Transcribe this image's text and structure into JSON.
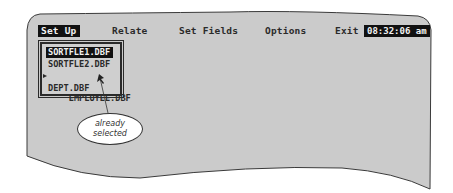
{
  "menu": {
    "items": [
      {
        "label": "Set Up",
        "active": true
      },
      {
        "label": "Relate",
        "active": false
      },
      {
        "label": "Set Fields",
        "active": false
      },
      {
        "label": "Options",
        "active": false
      },
      {
        "label": "Exit",
        "active": false
      }
    ],
    "clock": "08:32:06 am"
  },
  "file_list": {
    "items": [
      {
        "label": "SORTFLE1.DBF",
        "highlighted": true,
        "marked": false
      },
      {
        "label": "SORTFLE2.DBF",
        "highlighted": false,
        "marked": false
      },
      {
        "label": "EMPLOYEE.DBF",
        "highlighted": false,
        "marked": true
      },
      {
        "label": "DEPT.DBF",
        "highlighted": false,
        "marked": false
      }
    ]
  },
  "callout": {
    "line1": "already",
    "line2": "selected"
  },
  "colors": {
    "screen_bg": "#cbcbcb",
    "highlight_bg": "#111111",
    "highlight_fg": "#f2f2f2",
    "text": "#2a2a2a"
  }
}
